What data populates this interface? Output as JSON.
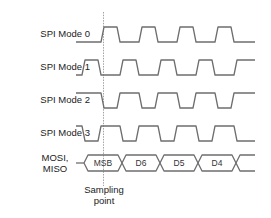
{
  "diagram": {
    "signals": [
      {
        "label": "SPI Mode 0",
        "idle": "low",
        "first_edge": "rising"
      },
      {
        "label": "SPI Mode 1",
        "idle": "low",
        "first_edge": "rising (shifted)"
      },
      {
        "label": "SPI Mode 2",
        "idle": "high",
        "first_edge": "falling"
      },
      {
        "label": "SPI Mode 3",
        "idle": "high",
        "first_edge": "falling (shifted)"
      }
    ],
    "data_line": {
      "label_line1": "MOSI,",
      "label_line2": "MISO",
      "bits": [
        "MSB",
        "D6",
        "D5",
        "D4"
      ]
    },
    "sampling": {
      "label_line1": "Sampling",
      "label_line2": "point"
    },
    "colors": {
      "waveform": "#6e6e6e",
      "text": "#222222",
      "background": "#ffffff"
    }
  }
}
